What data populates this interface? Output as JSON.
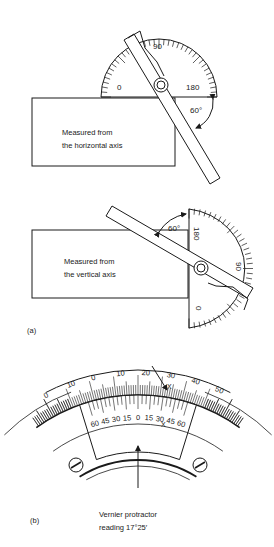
{
  "figure_a": {
    "label": "(a)",
    "top": {
      "caption_line1": "Measured from",
      "caption_line2": "the horizontal axis",
      "scale_labels": {
        "left": "0",
        "top": "90",
        "right": "180"
      },
      "angle": "60°"
    },
    "bottom": {
      "caption_line1": "Measured from",
      "caption_line2": "the vertical axis",
      "scale_labels": {
        "bottom": "0",
        "right": "90",
        "top": "180"
      },
      "angle": "60°"
    }
  },
  "figure_b": {
    "label": "(b)",
    "caption_line1": "Vernier protractor",
    "caption_line2": "reading 17°25′",
    "main_scale_labels": [
      "0",
      "10",
      "0",
      "10",
      "20",
      "30",
      "40",
      "50"
    ],
    "vernier_labels_left": [
      "60",
      "45",
      "30",
      "15"
    ],
    "vernier_zero": "0",
    "vernier_labels_right": [
      "15",
      "30",
      "45",
      "60"
    ],
    "coincidence_mark": "X"
  },
  "colors": {
    "ink": "#1a1a1a",
    "background": "#ffffff"
  }
}
